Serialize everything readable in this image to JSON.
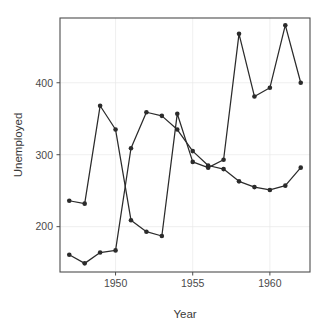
{
  "chart_data": {
    "type": "line",
    "title": "",
    "xlabel": "Year",
    "ylabel": "Unemployed",
    "xlim": [
      1946.4,
      1962.6
    ],
    "ylim": [
      137,
      490
    ],
    "grid": true,
    "legend": "none",
    "xticks": [
      1950,
      1955,
      1960
    ],
    "xtick_labels": [
      "1950",
      "1955",
      "1960"
    ],
    "yticks": [
      200,
      300,
      400
    ],
    "ytick_labels": [
      "200",
      "300",
      "400"
    ],
    "x": [
      1947,
      1948,
      1949,
      1950,
      1951,
      1952,
      1953,
      1954,
      1955,
      1956,
      1957,
      1958,
      1959,
      1960,
      1961,
      1962
    ],
    "series": [
      {
        "name": "series-a",
        "marker": "filled-circle",
        "color": "#2b2b2b",
        "values": [
          236,
          232,
          368,
          335,
          209,
          193,
          187,
          357,
          290,
          282,
          293,
          468,
          381,
          393,
          480,
          400
        ]
      },
      {
        "name": "series-b",
        "marker": "filled-circle",
        "color": "#2b2b2b",
        "values": [
          161,
          149,
          164,
          167,
          309,
          359,
          354,
          335,
          305,
          285,
          280,
          263,
          255,
          251,
          257,
          282
        ]
      }
    ]
  },
  "axes": {
    "y_title": "Unemployed",
    "x_title": "Year"
  }
}
